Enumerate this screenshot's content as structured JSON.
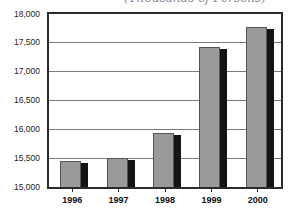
{
  "chart_data": {
    "type": "bar",
    "title_clipped": "(Thousands of Persons)",
    "categories": [
      "1996",
      "1997",
      "1998",
      "1999",
      "2000"
    ],
    "values": [
      15450,
      15500,
      15940,
      17420,
      17780
    ],
    "xlabel": "",
    "ylabel": "",
    "ylim": [
      15000,
      18000
    ],
    "ytick_interval": 500,
    "yticks": [
      18000,
      17500,
      17000,
      16500,
      16000,
      15500,
      15000
    ],
    "ytick_labels": [
      "18,000",
      "17,500",
      "17,000",
      "16,500",
      "16,000",
      "15,500",
      "15,000"
    ],
    "grid": true,
    "legend": false
  },
  "colors": {
    "background": "#ffffff",
    "bar_fill": "#9a9a9a",
    "bar_outline": "#555555",
    "bar_shadow": "#141414",
    "frame": "#2b2b2b",
    "gridline": "#7a7a7a",
    "axis_label": "#1c1c1c",
    "title": "#8a8a8a"
  }
}
